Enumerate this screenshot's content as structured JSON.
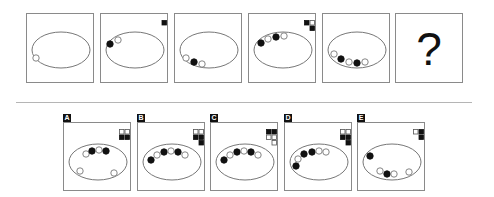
{
  "puzzle": {
    "question_mark": "?",
    "colors": {
      "stroke": "#777777",
      "fill_dark": "#111111",
      "frame_border": "#8a8a8a",
      "separator": "#b5b5b5"
    },
    "sequence": [
      {
        "index": 1,
        "circles": [
          {
            "x": -25,
            "y": 8,
            "filled": false
          }
        ],
        "squares": []
      },
      {
        "index": 2,
        "circles": [
          {
            "x": -25,
            "y": -6,
            "filled": true
          },
          {
            "x": -17,
            "y": -10,
            "filled": false
          }
        ],
        "squares": [
          {
            "col": 1,
            "row": 0,
            "filled": true
          }
        ]
      },
      {
        "index": 3,
        "circles": [
          {
            "x": -23,
            "y": 8,
            "filled": false
          },
          {
            "x": -15,
            "y": 12,
            "filled": true
          },
          {
            "x": -7,
            "y": 14,
            "filled": false
          }
        ],
        "squares": []
      },
      {
        "index": 4,
        "circles": [
          {
            "x": -22,
            "y": -7,
            "filled": true
          },
          {
            "x": -15,
            "y": -11,
            "filled": false
          },
          {
            "x": -7,
            "y": -13,
            "filled": true
          },
          {
            "x": 1,
            "y": -14,
            "filled": false
          }
        ],
        "squares": [
          {
            "col": 0,
            "row": 0,
            "filled": true
          },
          {
            "col": 1,
            "row": 0,
            "filled": false
          },
          {
            "col": 1,
            "row": 1,
            "filled": true
          }
        ]
      },
      {
        "index": 5,
        "circles": [
          {
            "x": -23,
            "y": 4,
            "filled": false
          },
          {
            "x": -16,
            "y": 9,
            "filled": true
          },
          {
            "x": -8,
            "y": 12,
            "filled": false
          },
          {
            "x": 0,
            "y": 13,
            "filled": true
          },
          {
            "x": 8,
            "y": 12,
            "filled": false
          }
        ],
        "squares": []
      },
      {
        "index": 6,
        "unknown": true
      }
    ],
    "options": [
      {
        "label": "A",
        "circles": [
          {
            "x": -12,
            "y": -8,
            "filled": false
          },
          {
            "x": -6,
            "y": -11,
            "filled": true
          },
          {
            "x": 1,
            "y": -12,
            "filled": false
          },
          {
            "x": 8,
            "y": -11,
            "filled": true
          },
          {
            "x": -18,
            "y": 9,
            "filled": false
          },
          {
            "x": 16,
            "y": 11,
            "filled": false
          }
        ],
        "squares": [
          {
            "col": 0,
            "row": 0,
            "filled": false
          },
          {
            "col": 1,
            "row": 0,
            "filled": false
          },
          {
            "col": 0,
            "row": 1,
            "filled": true
          },
          {
            "col": 1,
            "row": 1,
            "filled": true
          }
        ]
      },
      {
        "label": "B",
        "circles": [
          {
            "x": -21,
            "y": -2,
            "filled": true
          },
          {
            "x": -15,
            "y": -7,
            "filled": false
          },
          {
            "x": -8,
            "y": -10,
            "filled": true
          },
          {
            "x": -1,
            "y": -11,
            "filled": false
          },
          {
            "x": 6,
            "y": -10,
            "filled": true
          },
          {
            "x": 13,
            "y": -7,
            "filled": false
          }
        ],
        "squares": [
          {
            "col": 0,
            "row": 0,
            "filled": false
          },
          {
            "col": 1,
            "row": 0,
            "filled": false
          },
          {
            "col": 0,
            "row": 1,
            "filled": true
          },
          {
            "col": 1,
            "row": 1,
            "filled": true
          },
          {
            "col": 1,
            "row": 2,
            "filled": true
          }
        ]
      },
      {
        "label": "C",
        "circles": [
          {
            "x": -21,
            "y": -2,
            "filled": true
          },
          {
            "x": -15,
            "y": -7,
            "filled": false
          },
          {
            "x": -8,
            "y": -10,
            "filled": true
          },
          {
            "x": -1,
            "y": -11,
            "filled": false
          },
          {
            "x": 6,
            "y": -10,
            "filled": true
          },
          {
            "x": 13,
            "y": -7,
            "filled": false
          }
        ],
        "squares": [
          {
            "col": 0,
            "row": 0,
            "filled": true
          },
          {
            "col": 1,
            "row": 0,
            "filled": true
          },
          {
            "col": 0,
            "row": 1,
            "filled": false
          },
          {
            "col": 1,
            "row": 1,
            "filled": false
          },
          {
            "col": 1,
            "row": 2,
            "filled": false
          }
        ]
      },
      {
        "label": "D",
        "circles": [
          {
            "x": -23,
            "y": 4,
            "filled": true
          },
          {
            "x": -21,
            "y": -3,
            "filled": false
          },
          {
            "x": -15,
            "y": -8,
            "filled": true
          },
          {
            "x": -7,
            "y": -10,
            "filled": true
          },
          {
            "x": 0,
            "y": -11,
            "filled": false
          },
          {
            "x": 7,
            "y": -10,
            "filled": false
          }
        ],
        "squares": [
          {
            "col": 0,
            "row": 0,
            "filled": false
          },
          {
            "col": 1,
            "row": 0,
            "filled": false
          },
          {
            "col": 0,
            "row": 1,
            "filled": true
          },
          {
            "col": 1,
            "row": 1,
            "filled": true
          },
          {
            "col": 1,
            "row": 2,
            "filled": true
          }
        ]
      },
      {
        "label": "E",
        "circles": [
          {
            "x": -22,
            "y": -6,
            "filled": true
          },
          {
            "x": -12,
            "y": 9,
            "filled": false
          },
          {
            "x": -5,
            "y": 12,
            "filled": true
          },
          {
            "x": 2,
            "y": 12,
            "filled": false
          },
          {
            "x": 17,
            "y": 10,
            "filled": false
          }
        ],
        "squares": [
          {
            "col": 0,
            "row": 0,
            "filled": false
          },
          {
            "col": 1,
            "row": 0,
            "filled": true
          },
          {
            "col": 1,
            "row": 1,
            "filled": true
          }
        ]
      }
    ]
  }
}
